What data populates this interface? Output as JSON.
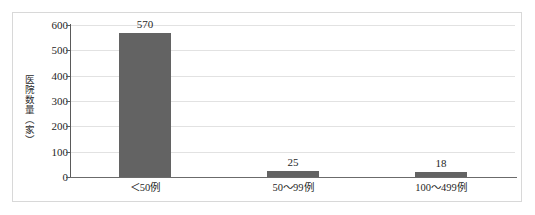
{
  "chart_data": {
    "type": "bar",
    "title": "",
    "subtitle": "",
    "xlabel": "",
    "ylabel": "医院数量（家）",
    "categories": [
      "＜50例",
      "50～99例",
      "100～499例"
    ],
    "values": [
      570,
      25,
      18
    ],
    "data_labels": [
      "570",
      "25",
      "18"
    ],
    "ylim": [
      0,
      600
    ],
    "y_ticks": [
      600,
      500,
      400,
      300,
      200,
      100,
      0
    ],
    "y_tick_labels": [
      "600",
      "500",
      "400",
      "300",
      "200",
      "100",
      "0"
    ],
    "grid": true,
    "grid_axis": "y",
    "legend": false,
    "legend_position": "none",
    "bar_color": "#636363",
    "gridline_color": "#e2e2e2",
    "axis_color": "#5a5a5a",
    "border_color": "#d8d8d8",
    "background_color": "#ffffff",
    "text_color": "#1f1f1f"
  }
}
